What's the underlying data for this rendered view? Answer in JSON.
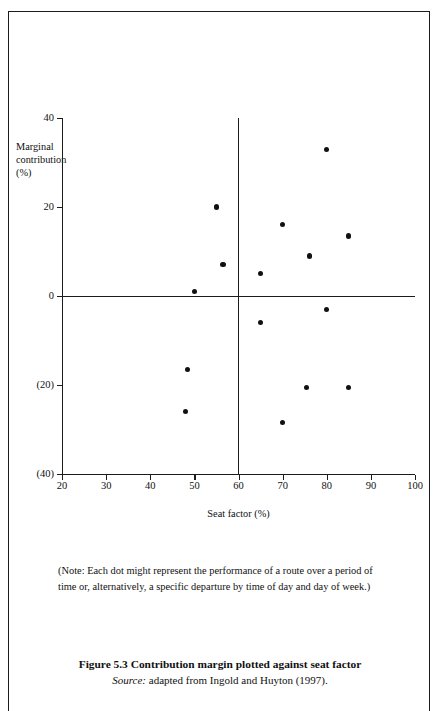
{
  "figure": {
    "caption_title": "Figure 5.3  Contribution margin plotted against seat factor",
    "source_label": "Source:",
    "source_text": " adapted from Ingold and Huyton (1997).",
    "note": "(Note: Each dot might represent the performance of a route over a period of time or, alternatively, a specific departure by time of day and day of week.)"
  },
  "chart_data": {
    "type": "scatter",
    "title": "Contribution margin plotted against seat factor",
    "xlabel": "Seat factor (%)",
    "ylabel": "Marginal contribution (%)",
    "ylabel_lines": [
      "Marginal",
      "contribution",
      "(%)"
    ],
    "xlim": [
      20,
      100
    ],
    "ylim": [
      -40,
      40
    ],
    "xticks": [
      20,
      30,
      40,
      50,
      60,
      70,
      80,
      90,
      100
    ],
    "xticklabels": [
      "20",
      "30",
      "40",
      "50",
      "60",
      "70",
      "80",
      "90",
      "100"
    ],
    "yticks": [
      40,
      20,
      0,
      -20,
      -40
    ],
    "yticklabels": [
      "40",
      "20",
      "0",
      "(20)",
      "(40)"
    ],
    "grid": false,
    "legend": null,
    "reference_lines": [
      {
        "axis": "y",
        "value": 0
      },
      {
        "axis": "x",
        "value": 60
      }
    ],
    "points": [
      {
        "x": 48.0,
        "y": -26.0
      },
      {
        "x": 48.5,
        "y": -16.5
      },
      {
        "x": 50.0,
        "y": 1.0
      },
      {
        "x": 55.0,
        "y": 20.0
      },
      {
        "x": 56.5,
        "y": 7.0
      },
      {
        "x": 65.0,
        "y": 5.0
      },
      {
        "x": 65.0,
        "y": -6.0
      },
      {
        "x": 70.0,
        "y": 16.0
      },
      {
        "x": 70.0,
        "y": -28.5
      },
      {
        "x": 75.5,
        "y": -20.5
      },
      {
        "x": 76.0,
        "y": 9.0
      },
      {
        "x": 80.0,
        "y": 33.0
      },
      {
        "x": 80.0,
        "y": -3.0
      },
      {
        "x": 85.0,
        "y": 13.5
      },
      {
        "x": 85.0,
        "y": -20.5
      }
    ]
  }
}
